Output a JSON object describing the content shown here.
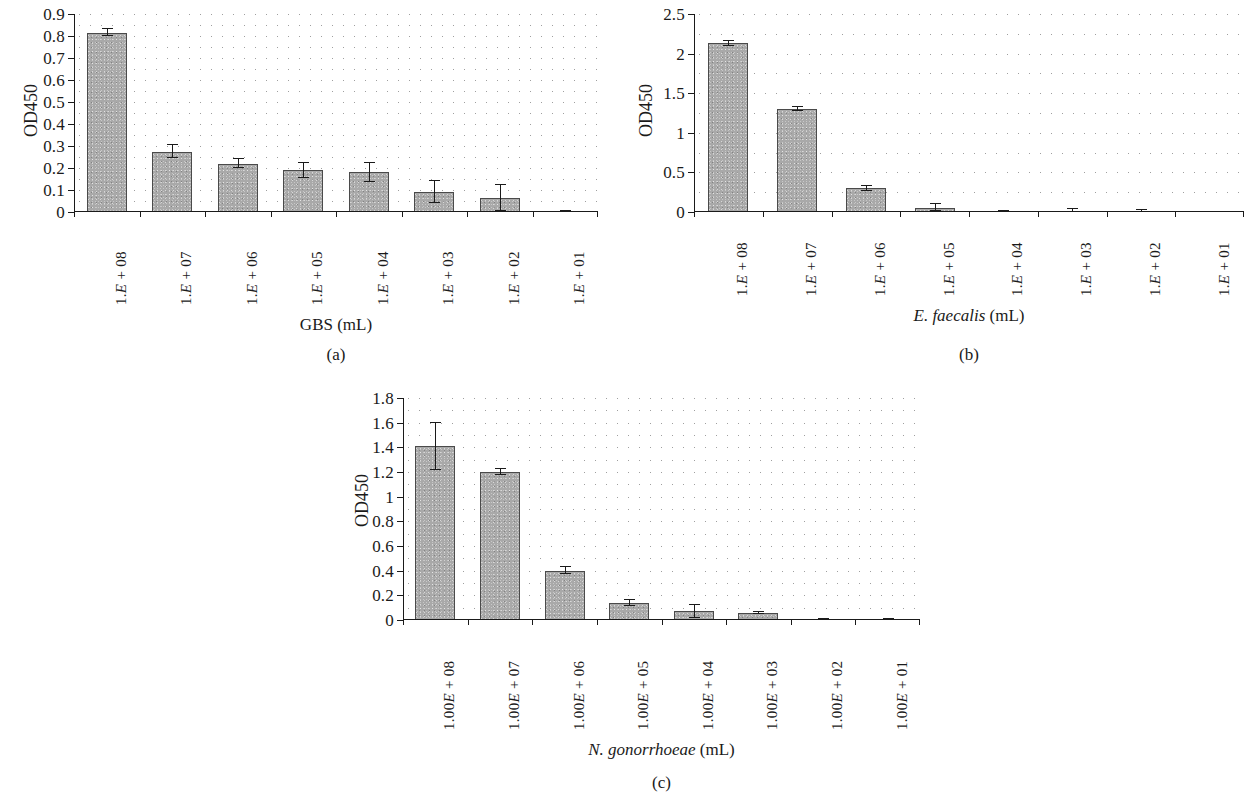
{
  "figure": {
    "panels": [
      {
        "tag": "(a)",
        "ylabel": "OD450",
        "xlabel_species": "GBS",
        "xlabel_unit": "(mL)",
        "xlabel_italic": false,
        "categories": [
          "1.E + 08",
          "1.E + 07",
          "1.E + 06",
          "1.E + 05",
          "1.E + 04",
          "1.E + 03",
          "1.E + 02",
          "1.E + 01"
        ],
        "cat_prefix": "1.",
        "cat_e": "E",
        "cat_suffix": [
          " + 08",
          " + 07",
          " + 06",
          " + 05",
          " + 04",
          " + 03",
          " + 02",
          " + 01"
        ],
        "yticks": [
          "0",
          "0.1",
          "0.2",
          "0.3",
          "0.4",
          "0.5",
          "0.6",
          "0.7",
          "0.8",
          "0.9"
        ],
        "ytick_values": [
          0,
          0.1,
          0.2,
          0.3,
          0.4,
          0.5,
          0.6,
          0.7,
          0.8,
          0.9
        ],
        "values": [
          0.815,
          0.275,
          0.22,
          0.19,
          0.18,
          0.09,
          0.065,
          0.002
        ],
        "errors": [
          0.015,
          0.03,
          0.02,
          0.035,
          0.045,
          0.05,
          0.06,
          0.002
        ]
      },
      {
        "tag": "(b)",
        "ylabel": "OD450",
        "xlabel_species": "E. faecalis",
        "xlabel_unit": "(mL)",
        "xlabel_italic": true,
        "categories": [
          "1.E + 08",
          "1.E + 07",
          "1.E + 06",
          "1.E + 05",
          "1.E + 04",
          "1.E + 03",
          "1.E + 02",
          "1.E + 01"
        ],
        "cat_prefix": "1.",
        "cat_e": "E",
        "cat_suffix": [
          " + 08",
          " + 07",
          " + 06",
          " + 05",
          " + 04",
          " + 03",
          " + 02",
          " + 01"
        ],
        "yticks": [
          "0",
          "0.5",
          "1",
          "1.5",
          "2",
          "2.5"
        ],
        "ytick_values": [
          0,
          0.5,
          1,
          1.5,
          2,
          2.5
        ],
        "values": [
          2.13,
          1.3,
          0.3,
          0.055,
          0.005,
          0.005,
          0.005,
          0.0
        ],
        "errors": [
          0.035,
          0.02,
          0.03,
          0.045,
          0.005,
          0.03,
          0.02,
          0.0
        ]
      },
      {
        "tag": "(c)",
        "ylabel": "OD450",
        "xlabel_species": "N. gonorrhoeae",
        "xlabel_unit": "(mL)",
        "xlabel_italic": true,
        "categories": [
          "1.00E + 08",
          "1.00E + 07",
          "1.00E + 06",
          "1.00E + 05",
          "1.00E + 04",
          "1.00E + 03",
          "1.00E + 02",
          "1.00E + 01"
        ],
        "cat_prefix": "1.00",
        "cat_e": "E",
        "cat_suffix": [
          " + 08",
          " + 07",
          " + 06",
          " + 05",
          " + 04",
          " + 03",
          " + 02",
          " + 01"
        ],
        "yticks": [
          "0",
          "0.2",
          "0.4",
          "0.6",
          "0.8",
          "1",
          "1.2",
          "1.4",
          "1.6",
          "1.8"
        ],
        "ytick_values": [
          0,
          0.2,
          0.4,
          0.6,
          0.8,
          1,
          1.2,
          1.4,
          1.6,
          1.8
        ],
        "values": [
          1.41,
          1.2,
          0.4,
          0.14,
          0.07,
          0.055,
          0.008,
          0.006
        ],
        "errors": [
          0.19,
          0.025,
          0.03,
          0.025,
          0.05,
          0.01,
          0.004,
          0.004
        ]
      }
    ],
    "colors": {
      "bar_fill": "#a9a9a9",
      "bar_border": "#4a4a4a",
      "axis": "#1a1a1a",
      "grid_dot": "#9a9a9a"
    }
  }
}
